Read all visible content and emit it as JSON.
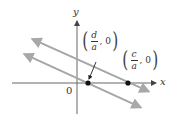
{
  "diagram": {
    "axes": {
      "x_label": "x",
      "y_label": "y",
      "origin_label": "0"
    },
    "points": [
      {
        "name": "d-over-a",
        "numerator": "d",
        "denominator": "a",
        "rest": ", 0"
      },
      {
        "name": "c-over-a",
        "numerator": "c",
        "denominator": "a",
        "rest": ", 0"
      }
    ],
    "lines": [
      {
        "name": "upper-line",
        "color": "#a8a8a8"
      },
      {
        "name": "lower-line",
        "color": "#a8a8a8"
      }
    ],
    "colors": {
      "axis": "#555555",
      "line": "#a8a8a8",
      "point": "#111111"
    }
  }
}
